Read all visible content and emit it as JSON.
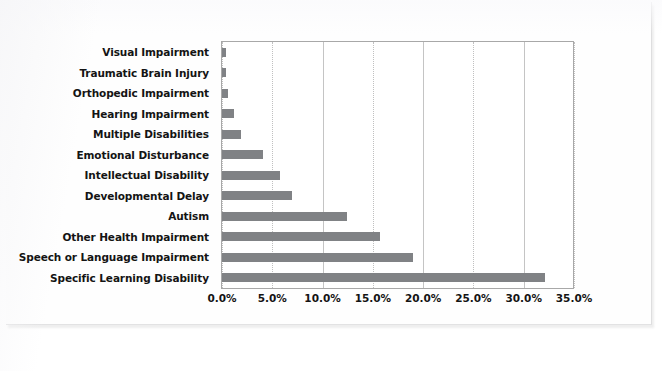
{
  "chart_data": {
    "type": "bar",
    "orientation": "horizontal",
    "title": "",
    "xlabel": "",
    "ylabel": "",
    "xlim": [
      0,
      35
    ],
    "xticks": [
      "0.0%",
      "5.0%",
      "10.0%",
      "15.0%",
      "20.0%",
      "25.0%",
      "30.0%",
      "35.0%"
    ],
    "xtick_values": [
      0,
      5,
      10,
      15,
      20,
      25,
      30,
      35
    ],
    "grid": true,
    "legend": false,
    "bar_color": "#808285",
    "categories": [
      "Visual Impairment",
      "Traumatic Brain Injury",
      "Orthopedic Impairment",
      "Hearing Impairment",
      "Multiple Disabilities",
      "Emotional Disturbance",
      "Intellectual Disability",
      "Developmental Delay",
      "Autism",
      "Other Health Impairment",
      "Speech or Language Impairment",
      "Specific Learning Disability"
    ],
    "values": [
      0.4,
      0.4,
      0.6,
      1.2,
      1.9,
      4.1,
      5.8,
      7.0,
      12.4,
      15.7,
      19.0,
      32.1
    ]
  }
}
